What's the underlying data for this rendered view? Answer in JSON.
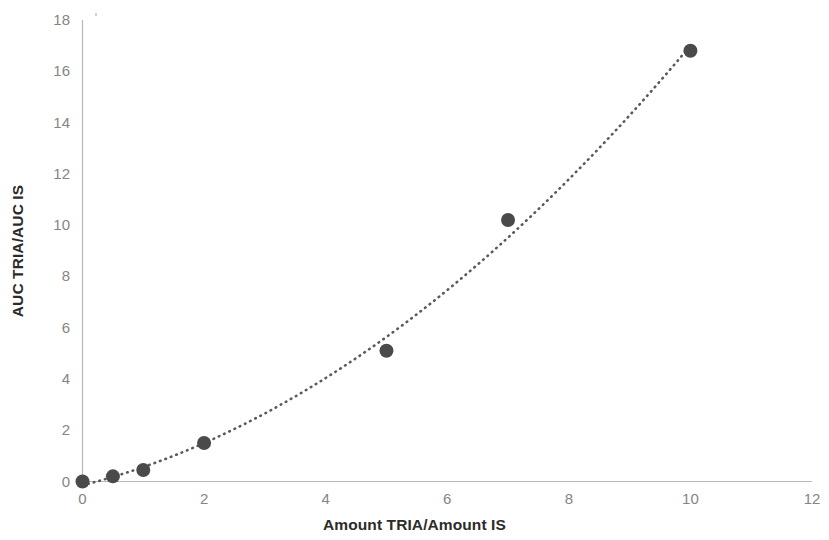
{
  "chart_data": {
    "type": "scatter",
    "title": "",
    "xlabel": "Amount TRIA/Amount IS",
    "ylabel": "AUC TRIA/AUC IS",
    "xlim": [
      0,
      12
    ],
    "ylim": [
      0,
      18
    ],
    "xticks": [
      0,
      2,
      4,
      6,
      8,
      10,
      12
    ],
    "yticks": [
      0,
      2,
      4,
      6,
      8,
      10,
      12,
      14,
      16,
      18
    ],
    "xtick_labels": [
      "0",
      "2",
      "4",
      "6",
      "8",
      "10",
      "12"
    ],
    "ytick_labels": [
      "0",
      "2",
      "4",
      "6",
      "8",
      "10",
      "12",
      "14",
      "16",
      "18"
    ],
    "grid": false,
    "legend": null,
    "marker_color": "#4a4a4a",
    "marker_shape": "circle",
    "marker_size_px": 14,
    "trendline": {
      "style": "dotted",
      "color": "#5a5a5a",
      "description": "quadratic fit through points"
    },
    "series": [
      {
        "name": "Calibration curve",
        "x": [
          0,
          0.5,
          1,
          2,
          5,
          7,
          10
        ],
        "y": [
          0.0,
          0.2,
          0.45,
          1.5,
          5.1,
          10.2,
          16.8
        ]
      }
    ],
    "axis_color": "#b8b8b8",
    "tick_label_color": "#858585",
    "axis_title_color": "#2b2b2b",
    "background": "#ffffff"
  }
}
